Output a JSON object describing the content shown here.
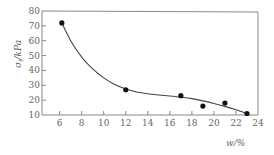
{
  "chart_data": {
    "type": "scatter",
    "title": "",
    "xlabel": "w/%",
    "ylabel": "σt/kPa",
    "xlim": [
      4.4,
      24
    ],
    "ylim": [
      10,
      80
    ],
    "x_ticks": [
      6,
      8,
      10,
      12,
      14,
      16,
      18,
      20,
      22,
      24
    ],
    "y_ticks": [
      10,
      20,
      30,
      40,
      50,
      60,
      70,
      80
    ],
    "grid": false,
    "legend": null,
    "series": [
      {
        "name": "measured",
        "marker": "filled-circle",
        "x": [
          6.2,
          12,
          17,
          19,
          21,
          23
        ],
        "y": [
          72,
          27,
          23,
          16,
          18,
          11
        ]
      },
      {
        "name": "fitted curve",
        "style": "line",
        "x": [
          6.2,
          7,
          8,
          9,
          10,
          11,
          12,
          13,
          14,
          15,
          16,
          17,
          18,
          19,
          20,
          21,
          22,
          23
        ],
        "y": [
          72,
          60,
          49,
          41,
          35,
          30.5,
          27.5,
          25.5,
          24.3,
          23.5,
          22.8,
          22,
          21,
          19.5,
          17.8,
          15.8,
          13.5,
          11
        ]
      }
    ]
  },
  "axes": {
    "xlabel": "w/%",
    "ylabel_main": "σ",
    "ylabel_sub": "t",
    "ylabel_unit": "/kPa"
  }
}
